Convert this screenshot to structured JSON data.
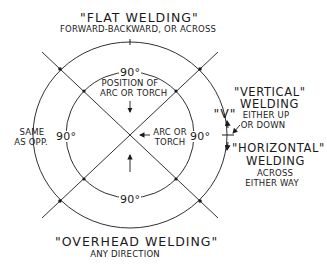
{
  "diagram": {
    "flat": {
      "title": "\"FLAT WELDING\"",
      "subtitle": "FORWARD-BACKWARD, OR ACROSS"
    },
    "overhead": {
      "title": "\"OVERHEAD WELDING\"",
      "subtitle": "ANY DIRECTION"
    },
    "vertical": {
      "title_line1": "\"VERTICAL\"",
      "title_line2": "WELDING",
      "sub_line1": "EITHER UP",
      "sub_line2": "OR DOWN",
      "marker": "\"V\""
    },
    "horizontal": {
      "title_line1": "\"HORIZONTAL\"",
      "title_line2": "WELDING",
      "sub_line1": "ACROSS",
      "sub_line2": "EITHER WAY"
    },
    "left_note": {
      "line1": "SAME",
      "line2": "AS OPP."
    },
    "position_note": {
      "line1": "POSITION OF",
      "line2": "ARC OR TORCH"
    },
    "arc_note": {
      "line1": "ARC OR",
      "line2": "TORCH"
    },
    "angles": {
      "top": "90°",
      "left": "90°",
      "right": "90°",
      "bottom": "90°"
    },
    "colors": {
      "line": "#1a1a1a",
      "background": "#ffffff"
    }
  }
}
